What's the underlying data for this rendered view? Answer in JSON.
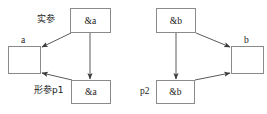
{
  "diagram": {
    "type": "pointer-parameter-passing",
    "left_group": {
      "actual_param_label": "实参",
      "formal_param_label": "形参p1",
      "variable_label": "a",
      "actual_box_text": "&a",
      "formal_box_text": "&a"
    },
    "right_group": {
      "actual_param_label": "",
      "formal_param_label": "p2",
      "variable_label": "b",
      "actual_box_text": "&b",
      "formal_box_text": "&b"
    },
    "colors": {
      "box_border": "#8a8a8a",
      "arrow": "#555555",
      "text": "#1a1a1a",
      "background": "#ffffff"
    }
  }
}
